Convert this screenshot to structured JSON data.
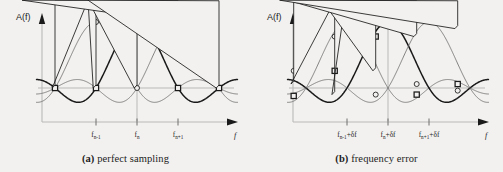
{
  "figure": {
    "background_color": "#f2f1ef",
    "ink_color": "#1a1a1a",
    "light_color": "#b9b9b9",
    "mid_color": "#6e6e6e"
  },
  "panels": [
    {
      "id": "a",
      "caption_tag": "(a)",
      "caption_text": "perfect sampling",
      "y_axis_label": "A(f)",
      "x_axis_label": "f",
      "tick_labels": [
        {
          "base": "f",
          "sub": "n-1",
          "suffix": ""
        },
        {
          "base": "f",
          "sub": "n",
          "suffix": ""
        },
        {
          "base": "f",
          "sub": "n+1",
          "suffix": ""
        }
      ]
    },
    {
      "id": "b",
      "caption_tag": "(b)",
      "caption_text": "frequency error",
      "y_axis_label": "A(f)",
      "x_axis_label": "f",
      "tick_labels": [
        {
          "base": "f",
          "sub": "n-1",
          "suffix": "+δf"
        },
        {
          "base": "f",
          "sub": "n",
          "suffix": "+δf"
        },
        {
          "base": "f",
          "sub": "n+1",
          "suffix": "+δf"
        }
      ]
    }
  ],
  "chart_data": {
    "type": "line",
    "title": "",
    "xlabel": "f",
    "ylabel": "A(f)",
    "grid": false,
    "legend_position": "none",
    "subplots": [
      {
        "id": "a",
        "caption": "(a) perfect sampling",
        "description": "Three overlapping sinc-shaped OFDM subcarrier spectra. Sample markers fall exactly on the peak of one subcarrier and on the zero crossings of the neighbours, so there is no inter-carrier interference.",
        "x_ticks": [
          -1,
          0,
          1
        ],
        "x_tick_labels": [
          "f_n-1",
          "f_n",
          "f_n+1"
        ],
        "xlim": [
          -2.35,
          2.35
        ],
        "ylim": [
          -0.33,
          1.18
        ],
        "sample_offset": 0.0,
        "series": [
          {
            "name": "subcarrier n-1",
            "center": -1,
            "marker": "circle",
            "weight": "thin",
            "sample_points": [
              {
                "x": -2,
                "y": 0
              },
              {
                "x": -1,
                "y": 1
              },
              {
                "x": 0,
                "y": 0
              },
              {
                "x": 1,
                "y": 0
              },
              {
                "x": 2,
                "y": 0
              }
            ]
          },
          {
            "name": "subcarrier n",
            "center": 0,
            "marker": "square",
            "weight": "thick",
            "sample_points": [
              {
                "x": -2,
                "y": 0
              },
              {
                "x": -1,
                "y": 0
              },
              {
                "x": 0,
                "y": 1
              },
              {
                "x": 1,
                "y": 0
              },
              {
                "x": 2,
                "y": 0
              }
            ]
          },
          {
            "name": "subcarrier n+1",
            "center": 1,
            "marker": "triangle",
            "weight": "thin",
            "sample_points": [
              {
                "x": -2,
                "y": 0
              },
              {
                "x": -1,
                "y": 0
              },
              {
                "x": 0,
                "y": 0
              },
              {
                "x": 1,
                "y": 1
              },
              {
                "x": 2,
                "y": 0
              }
            ]
          }
        ]
      },
      {
        "id": "b",
        "caption": "(b) frequency error",
        "description": "The same three subcarrier spectra sampled with a frequency offset delta-f. The markers no longer fall on the peaks or on the zero crossings, so each sample picks up contributions from the neighbouring subcarriers (inter-carrier interference).",
        "x_ticks": [
          -1,
          0,
          1
        ],
        "x_tick_labels": [
          "f_n-1+δf",
          "f_n+δf",
          "f_n+1+δf"
        ],
        "xlim": [
          -2.35,
          2.35
        ],
        "ylim": [
          -0.33,
          1.18
        ],
        "sample_offset": -0.3,
        "series": [
          {
            "name": "subcarrier n-1",
            "center": -1,
            "marker": "circle",
            "weight": "thin",
            "sample_points": [
              {
                "x": -2.3,
                "y": 0.26
              },
              {
                "x": -1.3,
                "y": 0.78
              },
              {
                "x": -0.3,
                "y": -0.1
              },
              {
                "x": 0.7,
                "y": 0.06
              },
              {
                "x": 1.7,
                "y": -0.04
              }
            ]
          },
          {
            "name": "subcarrier n",
            "center": 0,
            "marker": "square",
            "weight": "thick",
            "sample_points": [
              {
                "x": -2.3,
                "y": -0.12
              },
              {
                "x": -1.3,
                "y": 0.26
              },
              {
                "x": -0.3,
                "y": 0.78
              },
              {
                "x": 0.7,
                "y": -0.1
              },
              {
                "x": 1.7,
                "y": 0.06
              }
            ]
          },
          {
            "name": "subcarrier n+1",
            "center": 1,
            "marker": "triangle",
            "weight": "thin",
            "sample_points": [
              {
                "x": -2.3,
                "y": 0.06
              },
              {
                "x": -1.3,
                "y": -0.1
              },
              {
                "x": -0.3,
                "y": 0.26
              },
              {
                "x": 0.7,
                "y": 0.78
              },
              {
                "x": 1.7,
                "y": 0.9
              }
            ]
          }
        ]
      }
    ]
  }
}
